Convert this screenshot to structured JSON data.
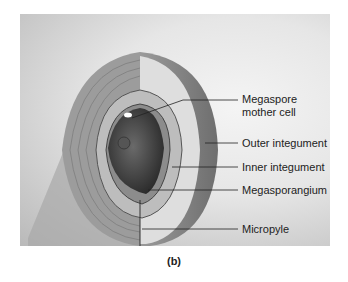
{
  "figure": {
    "caption": "(b)",
    "labels": [
      {
        "id": "megaspore-mother-cell",
        "line1": "Megaspore",
        "line2": "mother cell"
      },
      {
        "id": "outer-integument",
        "line1": "Outer integument"
      },
      {
        "id": "inner-integument",
        "line1": "Inner integument"
      },
      {
        "id": "megasporangium",
        "line1": "Megasporangium"
      },
      {
        "id": "micropyle",
        "line1": "Micropyle"
      }
    ]
  }
}
